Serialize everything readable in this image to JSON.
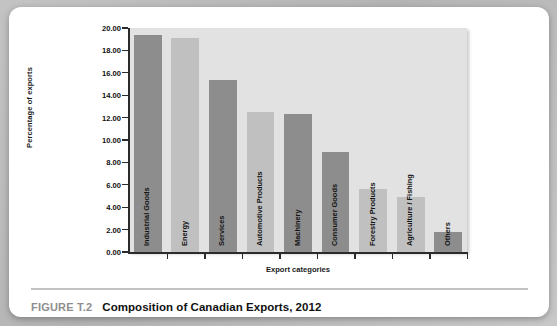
{
  "figure": {
    "number_label": "FIGURE T.2",
    "title": "Composition of Canadian Exports, 2012"
  },
  "colors": {
    "bar_dark": "#8d8d8d",
    "bar_light": "#c0c0c0",
    "plot_background": "#e2e2e2",
    "axis": "#2b2b2b",
    "card_background": "#ffffff",
    "page_background": "#bdbdbd",
    "caption_number": "#8e8e8e",
    "caption_title": "#111111"
  },
  "chart_data": {
    "type": "bar",
    "title": "Composition of Canadian Exports, 2012",
    "xlabel": "Export categories",
    "ylabel": "Percentage of exports",
    "ylim": [
      0,
      20
    ],
    "ytick_step": 2,
    "grid": false,
    "legend": "none",
    "categories": [
      "Industrial Goods",
      "Energy",
      "Services",
      "Automotive Products",
      "Machinery",
      "Consumer Goods",
      "Forestry Products",
      "Agriculture / Fishing",
      "Others"
    ],
    "values": [
      19.4,
      19.15,
      15.4,
      12.5,
      12.3,
      8.9,
      5.6,
      4.95,
      1.8
    ],
    "ytick_labels": [
      "0.00",
      "2.00",
      "4.00",
      "6.00",
      "8.00",
      "10.00",
      "12.00",
      "14.00",
      "16.00",
      "18.00",
      "20.00"
    ],
    "ytick_values": [
      0,
      2,
      4,
      6,
      8,
      10,
      12,
      14,
      16,
      18,
      20
    ],
    "bar_colors": [
      "#8d8d8d",
      "#c0c0c0",
      "#8d8d8d",
      "#c0c0c0",
      "#8d8d8d",
      "#8d8d8d",
      "#c0c0c0",
      "#c0c0c0",
      "#8d8d8d"
    ]
  }
}
